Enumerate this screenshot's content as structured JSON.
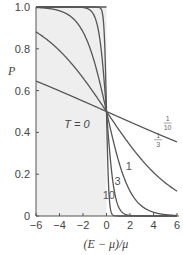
{
  "chart_data": {
    "type": "line",
    "title": "",
    "xlabel": "(E − μ)/μ",
    "ylabel": "P",
    "xlim": [
      -6,
      6
    ],
    "ylim": [
      0,
      1
    ],
    "xticks": [
      -6,
      -4,
      -2,
      0,
      2,
      4,
      6
    ],
    "xtick_labels": [
      "−6",
      "−4",
      "−2",
      "0",
      "2",
      "4",
      "6"
    ],
    "yticks": [
      0,
      0.2,
      0.4,
      0.6,
      0.8,
      1.0
    ],
    "ytick_labels": [
      "0",
      "0.2",
      "0.4",
      "0.6",
      "0.8",
      "1.0"
    ],
    "grid": false,
    "legend": "inline labels on curves",
    "formula": "P = 1 / (exp(k·x) + 1)",
    "series": [
      {
        "name": "10",
        "k": 10,
        "label": "10",
        "label_pos": [
          0.2,
          0.08
        ],
        "x": [
          -6,
          -1,
          -0.5,
          -0.2,
          0,
          0.2,
          0.5,
          1,
          6
        ],
        "values": [
          1.0,
          1.0,
          0.993,
          0.881,
          0.5,
          0.119,
          0.007,
          0.0,
          0.0
        ]
      },
      {
        "name": "3",
        "k": 3,
        "label": "3",
        "label_pos": [
          0.95,
          0.15
        ],
        "x": [
          -6,
          -2,
          -1,
          0,
          1,
          2,
          6
        ],
        "values": [
          1.0,
          0.998,
          0.953,
          0.5,
          0.047,
          0.002,
          0.0
        ]
      },
      {
        "name": "1",
        "k": 1,
        "label": "1",
        "label_pos": [
          1.9,
          0.22
        ],
        "x": [
          -6,
          -4,
          -2,
          0,
          2,
          4,
          6
        ],
        "values": [
          0.998,
          0.982,
          0.881,
          0.5,
          0.119,
          0.018,
          0.002
        ]
      },
      {
        "name": "1/3",
        "k": 0.3333,
        "label_num": "1",
        "label_den": "3",
        "label_pos": [
          4.4,
          0.36
        ],
        "x": [
          -6,
          -4,
          -2,
          0,
          2,
          4,
          6
        ],
        "values": [
          0.881,
          0.791,
          0.661,
          0.5,
          0.339,
          0.209,
          0.119
        ]
      },
      {
        "name": "1/10",
        "k": 0.1,
        "label_num": "1",
        "label_den": "10",
        "label_pos": [
          5.2,
          0.44
        ],
        "x": [
          -6,
          -4,
          -2,
          0,
          2,
          4,
          6
        ],
        "values": [
          0.646,
          0.599,
          0.55,
          0.5,
          0.45,
          0.401,
          0.354
        ]
      }
    ],
    "annotations": [
      {
        "text": "T = 0",
        "x": -3.6,
        "y": 0.42,
        "note": "shaded step function region, P=1 for x<0"
      }
    ],
    "shaded_region": {
      "x": [
        -6,
        0
      ],
      "y": [
        0,
        1
      ],
      "color": "#eeeeee"
    },
    "colors": {
      "curve": "#555555",
      "axis": "#555555",
      "shade": "#eeeeee",
      "text": "#444444"
    }
  },
  "labels": {
    "y_axis": "P",
    "x_axis": "(E − μ)/μ",
    "t_zero": "T = 0"
  }
}
